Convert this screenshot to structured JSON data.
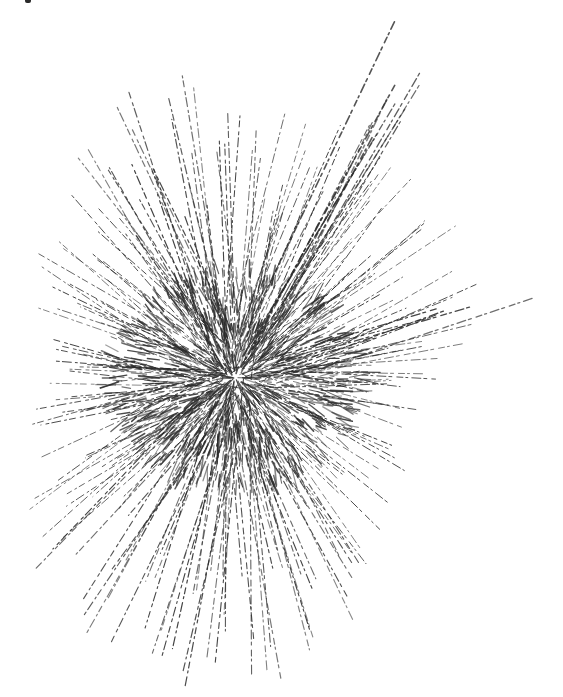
{
  "figure": {
    "background": "#ffffff",
    "ink_color": "#2b2b2b",
    "center": [
      235,
      378
    ],
    "core_radius": 70,
    "rays": [
      {
        "angle": -62,
        "length": 385,
        "width": 1.6
      },
      {
        "angle": -60,
        "length": 360,
        "width": 1.3
      },
      {
        "angle": -58,
        "length": 330,
        "width": 1.2
      },
      {
        "angle": -64,
        "length": 300,
        "width": 1.1
      },
      {
        "angle": -56,
        "length": 280,
        "width": 1.0
      },
      {
        "angle": -68,
        "length": 260,
        "width": 1.0
      },
      {
        "angle": -52,
        "length": 250,
        "width": 1.0
      },
      {
        "angle": -46,
        "length": 260,
        "width": 1.0
      },
      {
        "angle": -40,
        "length": 240,
        "width": 1.0
      },
      {
        "angle": -34,
        "length": 250,
        "width": 1.0
      },
      {
        "angle": -28,
        "length": 240,
        "width": 1.0
      },
      {
        "angle": -22,
        "length": 250,
        "width": 1.0
      },
      {
        "angle": -18,
        "length": 300,
        "width": 1.3
      },
      {
        "angle": -14,
        "length": 250,
        "width": 1.0
      },
      {
        "angle": -9,
        "length": 220,
        "width": 1.0
      },
      {
        "angle": -4,
        "length": 200,
        "width": 1.0
      },
      {
        "angle": 2,
        "length": 190,
        "width": 1.0
      },
      {
        "angle": 8,
        "length": 180,
        "width": 1.0
      },
      {
        "angle": 14,
        "length": 170,
        "width": 1.0
      },
      {
        "angle": 22,
        "length": 180,
        "width": 1.0
      },
      {
        "angle": 30,
        "length": 190,
        "width": 1.0
      },
      {
        "angle": 38,
        "length": 200,
        "width": 1.0
      },
      {
        "angle": 46,
        "length": 210,
        "width": 1.0
      },
      {
        "angle": 54,
        "length": 230,
        "width": 1.0
      },
      {
        "angle": 60,
        "length": 250,
        "width": 1.1
      },
      {
        "angle": 66,
        "length": 270,
        "width": 1.1
      },
      {
        "angle": 72,
        "length": 280,
        "width": 1.1
      },
      {
        "angle": 78,
        "length": 300,
        "width": 1.2
      },
      {
        "angle": 84,
        "length": 310,
        "width": 1.1
      },
      {
        "angle": 90,
        "length": 300,
        "width": 1.1
      },
      {
        "angle": 96,
        "length": 300,
        "width": 1.1
      },
      {
        "angle": 102,
        "length": 310,
        "width": 1.2
      },
      {
        "angle": 108,
        "length": 300,
        "width": 1.1
      },
      {
        "angle": 114,
        "length": 300,
        "width": 1.1
      },
      {
        "angle": 120,
        "length": 290,
        "width": 1.1
      },
      {
        "angle": 126,
        "length": 280,
        "width": 1.1
      },
      {
        "angle": 132,
        "length": 270,
        "width": 1.1
      },
      {
        "angle": 138,
        "length": 260,
        "width": 1.0
      },
      {
        "angle": 144,
        "length": 240,
        "width": 1.0
      },
      {
        "angle": 150,
        "length": 230,
        "width": 1.0
      },
      {
        "angle": 156,
        "length": 220,
        "width": 1.0
      },
      {
        "angle": 162,
        "length": 200,
        "width": 1.0
      },
      {
        "angle": 168,
        "length": 200,
        "width": 1.0
      },
      {
        "angle": 174,
        "length": 190,
        "width": 1.0
      },
      {
        "angle": 180,
        "length": 190,
        "width": 1.0
      },
      {
        "angle": 186,
        "length": 190,
        "width": 1.0
      },
      {
        "angle": 192,
        "length": 200,
        "width": 1.0
      },
      {
        "angle": 198,
        "length": 210,
        "width": 1.0
      },
      {
        "angle": 204,
        "length": 210,
        "width": 1.0
      },
      {
        "angle": 210,
        "length": 220,
        "width": 1.0
      },
      {
        "angle": 216,
        "length": 220,
        "width": 1.0
      },
      {
        "angle": 222,
        "length": 230,
        "width": 1.0
      },
      {
        "angle": 228,
        "length": 240,
        "width": 1.0
      },
      {
        "angle": 234,
        "length": 260,
        "width": 1.1
      },
      {
        "angle": 240,
        "length": 280,
        "width": 1.1
      },
      {
        "angle": 246,
        "length": 300,
        "width": 1.2
      },
      {
        "angle": 252,
        "length": 300,
        "width": 1.2
      },
      {
        "angle": 258,
        "length": 310,
        "width": 1.2
      },
      {
        "angle": 264,
        "length": 290,
        "width": 1.1
      },
      {
        "angle": 270,
        "length": 270,
        "width": 1.1
      },
      {
        "angle": 276,
        "length": 250,
        "width": 1.0
      },
      {
        "angle": 282,
        "length": 260,
        "width": 1.0
      },
      {
        "angle": 288,
        "length": 270,
        "width": 1.0
      }
    ],
    "extra_rays_per_direction": 3,
    "dash_pattern": "6 3 2 4 9 3 3 5"
  }
}
